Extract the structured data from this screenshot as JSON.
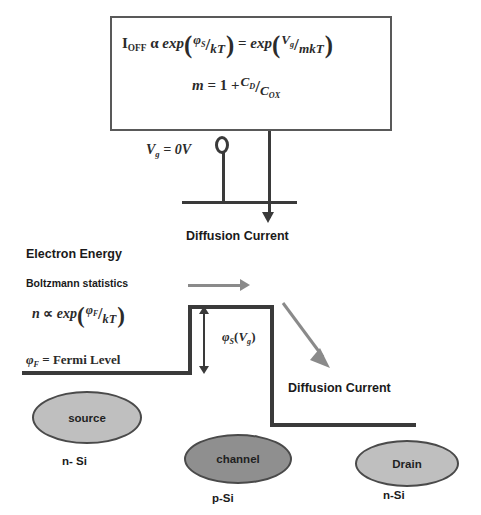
{
  "diagram": {
    "formula_box": {
      "line1": {
        "lhs_symbol": "I",
        "lhs_subscript": "OFF",
        "proportional": "α",
        "exp1": "exp",
        "exp1_num_symbol": "φ",
        "exp1_num_sub": "S",
        "exp1_den": "kT",
        "equals": "=",
        "exp2": "exp",
        "exp2_num_symbol": "V",
        "exp2_num_sub": "g",
        "exp2_den": "mkT",
        "plain_text": "I_OFF α exp(φ_S/kT) = exp(V_g/mkT)"
      },
      "line2": {
        "lhs": "m",
        "equals": "=",
        "one_plus": "1 +",
        "num_symbol": "C",
        "num_sub": "D",
        "den_symbol": "C",
        "den_sub": "OX",
        "plain_text": "m = 1 + C_D/C_OX"
      }
    },
    "circuit": {
      "gate_voltage_label": "V",
      "gate_voltage_sub": "g",
      "gate_voltage_value": "= 0V",
      "gate_voltage_plain": "V_g = 0V",
      "diffusion_current_label": "Diffusion Current"
    },
    "left_text": {
      "electron_energy": "Electron Energy",
      "boltzmann": "Boltzmann statistics",
      "n_formula": {
        "lhs": "n",
        "proportional": "∝",
        "exp": "exp",
        "num_symbol": "φ",
        "num_sub": "F",
        "den": "kT",
        "plain_text": "n ∝ exp(φ_F/kT)"
      },
      "fermi_level": {
        "symbol": "φ",
        "sub": "F",
        "text": "= Fermi Level",
        "plain_text": "φ_F = Fermi Level"
      }
    },
    "band_diagram": {
      "barrier_label": {
        "symbol": "φ",
        "sub": "S",
        "arg_open": "(",
        "arg_symbol": "V",
        "arg_sub": "g",
        "arg_close": ")",
        "plain_text": "φ_S(V_g)"
      },
      "diffusion_current_label": "Diffusion Current"
    },
    "regions": [
      {
        "name": "source",
        "ellipse_label": "source",
        "material_label": "n- Si",
        "fill": "#bfbfbf"
      },
      {
        "name": "channel",
        "ellipse_label": "channel",
        "material_label": "p-Si",
        "fill": "#8f8f8f"
      },
      {
        "name": "drain",
        "ellipse_label": "Drain",
        "material_label": "n-Si",
        "fill": "#bfbfbf"
      }
    ],
    "colors": {
      "line": "#3a3a3a",
      "box_border": "#595959",
      "gray_arrow": "#8a8a8a",
      "text": "#1a1a1a"
    }
  }
}
